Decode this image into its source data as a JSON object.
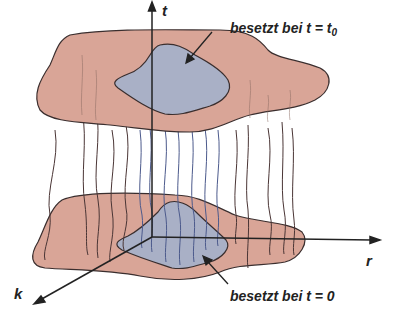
{
  "diagram": {
    "colors": {
      "outer_region": "#d9a597",
      "inner_region": "#a9b0c6",
      "outline": "#3a2e2e",
      "outer_strands": "#4a3535",
      "inner_strands": "#4c5a8c",
      "axis": "#222222"
    },
    "axes": {
      "t": "t",
      "r": "r",
      "k": "k"
    },
    "annotations": {
      "top": {
        "text": "besetzt bei t = t",
        "subscript": "0"
      },
      "bottom": {
        "text": "besetzt bei t = 0"
      }
    },
    "planes": [
      {
        "name": "top-plane",
        "time": "t = t0"
      },
      {
        "name": "bottom-plane",
        "time": "t = 0"
      }
    ]
  }
}
